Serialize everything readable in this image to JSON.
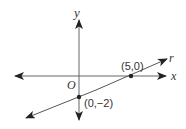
{
  "diagram": {
    "type": "coordinate-plane",
    "axes": {
      "x_label": "x",
      "y_label": "y",
      "origin_label": "O"
    },
    "line": {
      "name": "r",
      "points": [
        {
          "label": "(5,0)",
          "x": 5,
          "y": 0
        },
        {
          "label": "(0,−2)",
          "x": 0,
          "y": -2
        }
      ]
    },
    "colors": {
      "stroke": "#555555",
      "text": "#333333",
      "point": "#222222"
    }
  }
}
